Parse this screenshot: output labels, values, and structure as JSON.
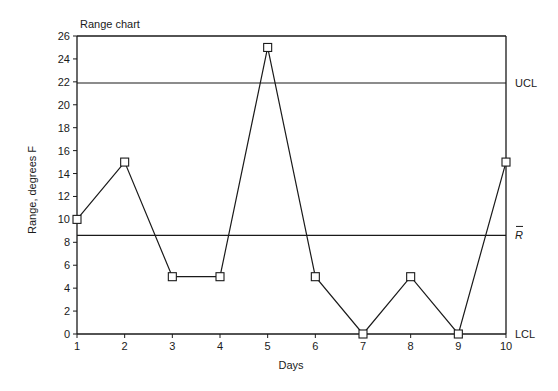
{
  "chart_data": {
    "type": "line",
    "title": "Range chart",
    "xlabel": "Days",
    "ylabel": "Range, degrees F",
    "x": [
      1,
      2,
      3,
      4,
      5,
      6,
      7,
      8,
      9,
      10
    ],
    "series": [
      {
        "name": "Range",
        "values": [
          10,
          15,
          5,
          5,
          25,
          5,
          0,
          5,
          0,
          15
        ],
        "marker": "open-square"
      }
    ],
    "xlim": [
      1,
      10
    ],
    "ylim": [
      0,
      26
    ],
    "xticks": [
      1,
      2,
      3,
      4,
      5,
      6,
      7,
      8,
      9,
      10
    ],
    "yticks": [
      0,
      2,
      4,
      6,
      8,
      10,
      12,
      14,
      16,
      18,
      20,
      22,
      24,
      26
    ],
    "reference_lines": [
      {
        "label": "UCL",
        "value": 21.9
      },
      {
        "label": "R̄",
        "value": 8.6
      },
      {
        "label": "LCL",
        "value": 0
      }
    ],
    "grid": false,
    "legend": "none"
  },
  "colors": {
    "line": "#1a1a1a",
    "background": "#ffffff"
  }
}
